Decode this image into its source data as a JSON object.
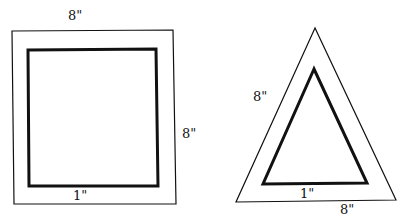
{
  "square": {
    "top_label": "8\"",
    "side_label": "8\"",
    "inner_label": "1\""
  },
  "triangle": {
    "side_label": "8\"",
    "base_label": "8\"",
    "inner_label": "1\""
  },
  "colors": {
    "stroke": "#111111",
    "background": "#ffffff"
  }
}
